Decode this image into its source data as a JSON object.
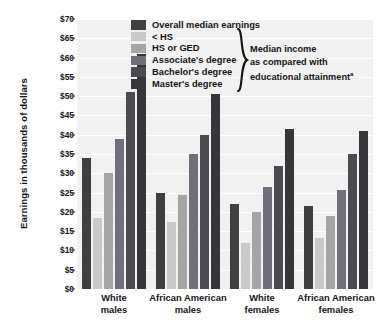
{
  "chart_data": {
    "type": "bar",
    "title": "",
    "xlabel": "",
    "ylabel": "Earnings in thousands of dollars",
    "ylim": [
      0,
      70
    ],
    "ytick_labels": [
      "$0",
      "$5",
      "$10",
      "$15",
      "$20",
      "$25",
      "$30",
      "$35",
      "$40",
      "$45",
      "$50",
      "$55",
      "$60",
      "$65",
      "$70"
    ],
    "ytick_values": [
      0,
      5,
      10,
      15,
      20,
      25,
      30,
      35,
      40,
      45,
      50,
      55,
      60,
      65,
      70
    ],
    "grid": true,
    "legend_position": "top-center",
    "categories": [
      "White males",
      "African American males",
      "White females",
      "African American females"
    ],
    "category_lines": [
      [
        "White",
        "males"
      ],
      [
        "African American",
        "males"
      ],
      [
        "White",
        "females"
      ],
      [
        "African American",
        "females"
      ]
    ],
    "series": [
      {
        "name": "Overall median earnings",
        "color": "#3f3f42",
        "values": [
          34.0,
          25.0,
          22.0,
          21.5
        ]
      },
      {
        "name": "< HS",
        "color": "#c9c9c9",
        "values": [
          18.5,
          17.3,
          12.0,
          13.3
        ]
      },
      {
        "name": "HS or GED",
        "color": "#a5a5a5",
        "values": [
          30.0,
          24.3,
          20.0,
          19.0
        ]
      },
      {
        "name": "Associate's degree",
        "color": "#70707a",
        "values": [
          39.0,
          35.0,
          26.5,
          25.8
        ]
      },
      {
        "name": "Bachelor's degree",
        "color": "#4a4a50",
        "values": [
          51.0,
          40.0,
          32.0,
          35.0
        ]
      },
      {
        "name": "Master's degree",
        "color": "#35353a",
        "values": [
          61.0,
          50.5,
          41.5,
          41.0
        ]
      }
    ],
    "annotation": {
      "line1": "Median income",
      "line2": "as compared with",
      "line3": "educational attainment",
      "footnote_marker": "a"
    }
  }
}
